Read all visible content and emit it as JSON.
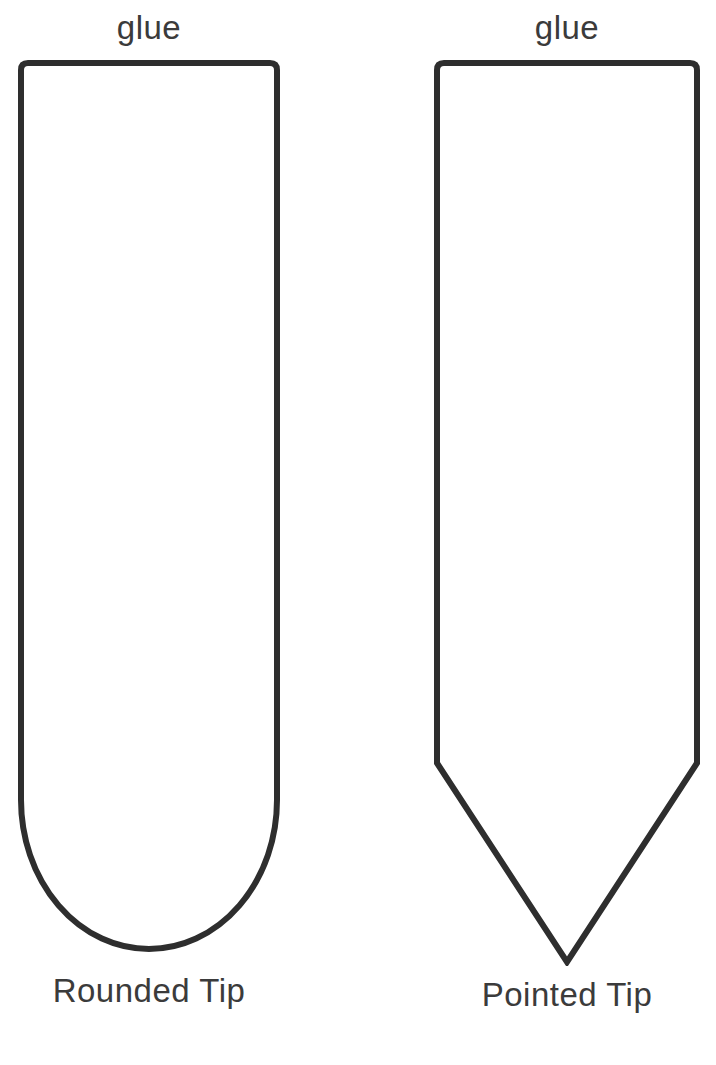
{
  "page": {
    "background": "#ffffff"
  },
  "colors": {
    "outline": "#2e2e2e",
    "label_text": "#3b3b3b"
  },
  "templates": [
    {
      "tip_type": "rounded",
      "glue_label": "glue",
      "tip_label": "Rounded Tip"
    },
    {
      "tip_type": "pointed",
      "glue_label": "glue",
      "tip_label": "Pointed Tip"
    }
  ]
}
